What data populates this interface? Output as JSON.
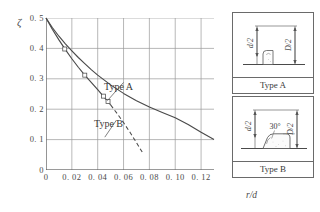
{
  "chart_data": {
    "type": "line",
    "title": "",
    "xlabel": "r/d",
    "ylabel": "ζ",
    "xlim": [
      0,
      0.13
    ],
    "ylim": [
      0,
      0.5
    ],
    "grid": true,
    "legend_position": "inline-annotations",
    "xticks": [
      0,
      0.02,
      0.04,
      0.06,
      0.08,
      0.1,
      0.12
    ],
    "xtick_labels": [
      "0",
      "0. 02",
      "0. 04",
      "0. 06",
      "0. 08",
      "0. 10",
      "0. 12"
    ],
    "yticks": [
      0,
      0.1,
      0.2,
      0.3,
      0.4,
      0.5
    ],
    "ytick_labels": [
      "0",
      "0. 1",
      "0. 2",
      "0. 3",
      "0. 4",
      "0. 5"
    ],
    "series": [
      {
        "name": "Type A",
        "style": "solid",
        "marker": "none",
        "x": [
          0.0,
          0.005,
          0.01,
          0.015,
          0.02,
          0.025,
          0.03,
          0.035,
          0.04,
          0.05,
          0.06,
          0.07,
          0.08,
          0.09,
          0.1,
          0.11,
          0.12,
          0.13
        ],
        "y": [
          0.5,
          0.468,
          0.44,
          0.415,
          0.392,
          0.37,
          0.35,
          0.33,
          0.312,
          0.28,
          0.252,
          0.228,
          0.207,
          0.189,
          0.172,
          0.15,
          0.124,
          0.1
        ]
      },
      {
        "name": "Type B",
        "style": "solid-then-dashed",
        "marker": "square",
        "dash_start_x": 0.05,
        "x": [
          0.0,
          0.005,
          0.01,
          0.015,
          0.02,
          0.025,
          0.03,
          0.035,
          0.04,
          0.045,
          0.05,
          0.055,
          0.06,
          0.065,
          0.07,
          0.075
        ],
        "y": [
          0.5,
          0.462,
          0.428,
          0.396,
          0.366,
          0.338,
          0.312,
          0.288,
          0.264,
          0.24,
          0.214,
          0.186,
          0.156,
          0.124,
          0.09,
          0.055
        ],
        "markers": [
          {
            "x": 0.0145,
            "y": 0.398
          },
          {
            "x": 0.03,
            "y": 0.312
          },
          {
            "x": 0.0445,
            "y": 0.243
          },
          {
            "x": 0.048,
            "y": 0.225
          }
        ]
      }
    ],
    "annotations": [
      {
        "text": "Type A",
        "x": 0.06,
        "y": 0.288,
        "leader_to": {
          "x": 0.0475,
          "y": 0.228
        }
      },
      {
        "text": "Type B",
        "x": 0.0545,
        "y": 0.164,
        "leader_to": {
          "x": 0.0455,
          "y": 0.108
        }
      }
    ]
  },
  "insets": [
    {
      "id": "type-a",
      "caption": "Type A",
      "dimension_left": "d/2",
      "dimension_right": "D/2",
      "profile": "rounded-fillet-shoulder"
    },
    {
      "id": "type-b",
      "caption": "Type B",
      "dimension_left": "d/2",
      "dimension_right": "D/2",
      "angle_label": "30°",
      "profile": "chamfered-tapered-shoulder"
    }
  ],
  "colors": {
    "curve": "#4a4a4a",
    "grid": "#9a9a9a",
    "axis": "#5a5a5a",
    "text": "#3a3a3a",
    "inset_border": "#6a6a6a"
  }
}
